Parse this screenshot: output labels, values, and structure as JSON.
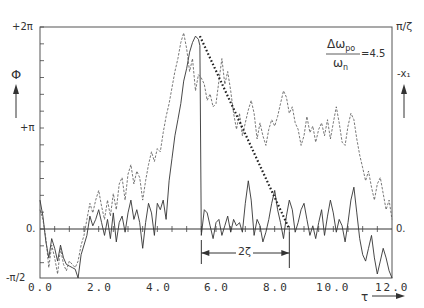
{
  "chart_data": {
    "type": "line",
    "title": "",
    "annotation": {
      "ratio_numerator": "Δω",
      "ratio_numerator_sub": "po",
      "ratio_denominator": "ω",
      "ratio_denominator_sub": "n",
      "ratio_value": "=4.5",
      "span_label": "2ζ",
      "span_start_tau": 5.5,
      "span_end_tau": 8.5
    },
    "xlabel": "τ",
    "ylabel_left": "Φ",
    "ylabel_right": "-x₁",
    "right_axis_top_label": "π/ζ",
    "right_axis_zero_label": "0.",
    "xlim": [
      0,
      12
    ],
    "ylim": [
      -1.5708,
      6.2832
    ],
    "x_ticks": [
      "0.0",
      "2.0",
      "4.0",
      "6.0",
      "8.0",
      "10.0",
      "12.0"
    ],
    "y_ticks_left": [
      "+2π",
      "+π",
      "0.",
      "-π/2"
    ],
    "grid": false,
    "series": [
      {
        "name": "Φ (solid)",
        "style": "solid",
        "x": [
          0.0,
          0.1,
          0.2,
          0.3,
          0.4,
          0.5,
          0.6,
          0.7,
          0.8,
          0.9,
          1.0,
          1.1,
          1.2,
          1.3,
          1.4,
          1.5,
          1.6,
          1.7,
          1.8,
          1.9,
          2.0,
          2.1,
          2.2,
          2.3,
          2.4,
          2.5,
          2.6,
          2.7,
          2.8,
          2.9,
          3.0,
          3.1,
          3.2,
          3.3,
          3.4,
          3.5,
          3.6,
          3.7,
          3.8,
          3.9,
          4.0,
          4.1,
          4.2,
          4.3,
          4.4,
          4.5,
          4.6,
          4.7,
          4.8,
          4.9,
          5.0,
          5.1,
          5.2,
          5.3,
          5.4,
          5.45,
          5.5,
          5.6,
          5.7,
          5.8,
          5.9,
          6.0,
          6.1,
          6.2,
          6.3,
          6.4,
          6.5,
          6.6,
          6.7,
          6.8,
          6.9,
          7.0,
          7.1,
          7.2,
          7.3,
          7.4,
          7.5,
          7.6,
          7.7,
          7.8,
          7.9,
          8.0,
          8.1,
          8.2,
          8.3,
          8.4,
          8.5,
          8.6,
          8.7,
          8.8,
          8.9,
          9.0,
          9.1,
          9.2,
          9.3,
          9.4,
          9.5,
          9.6,
          9.7,
          9.8,
          9.9,
          10.0,
          10.1,
          10.2,
          10.3,
          10.4,
          10.5,
          10.6,
          10.7,
          10.8,
          10.9,
          11.0,
          11.1,
          11.2,
          11.3,
          11.4,
          11.5,
          11.6,
          11.7,
          11.8,
          11.9,
          12.0
        ],
        "y": [
          0.9,
          0.4,
          -0.4,
          -0.9,
          -0.3,
          -0.6,
          -1.0,
          -0.5,
          -0.9,
          -1.1,
          -1.15,
          -1.2,
          -1.25,
          -1.57,
          -0.8,
          -0.5,
          -0.2,
          0.4,
          0.1,
          0.3,
          0.6,
          0.2,
          -0.2,
          0.3,
          -0.3,
          0.5,
          -0.4,
          0.2,
          0.4,
          -0.1,
          0.5,
          0.9,
          0.3,
          0.6,
          0.2,
          -0.6,
          0.2,
          0.8,
          0.5,
          -0.2,
          0.8,
          0.6,
          0.9,
          0.3,
          1.5,
          2.2,
          2.9,
          3.4,
          3.9,
          4.6,
          5.0,
          5.5,
          5.8,
          6.0,
          5.9,
          5.7,
          -0.2,
          0.6,
          0.5,
          0.1,
          -0.3,
          0.2,
          0.3,
          -0.2,
          0.1,
          0.4,
          -0.1,
          0.3,
          0.1,
          0.2,
          -0.1,
          0.8,
          1.5,
          0.9,
          -0.2,
          0.3,
          0.1,
          -0.4,
          -0.1,
          0.3,
          0.8,
          1.2,
          0.6,
          0.2,
          -0.3,
          0.4,
          0.9,
          0.6,
          -0.1,
          0.2,
          0.6,
          0.8,
          0.3,
          -0.2,
          0.1,
          -0.3,
          0.2,
          0.6,
          -0.2,
          0.4,
          0.9,
          0.5,
          -0.1,
          0.3,
          0.1,
          -0.4,
          0.2,
          0.9,
          1.3,
          0.5,
          -0.3,
          -0.8,
          -1.0,
          -0.6,
          -0.2,
          -0.9,
          -1.4,
          -1.0,
          -0.6,
          -0.9,
          -1.3,
          -1.57
        ]
      },
      {
        "name": "-x₁ (dashed)",
        "style": "dashed",
        "x": [
          0.0,
          0.1,
          0.2,
          0.3,
          0.4,
          0.5,
          0.6,
          0.7,
          0.8,
          0.9,
          1.0,
          1.1,
          1.2,
          1.3,
          1.4,
          1.5,
          1.6,
          1.7,
          1.8,
          1.9,
          2.0,
          2.1,
          2.2,
          2.3,
          2.4,
          2.5,
          2.6,
          2.7,
          2.8,
          2.9,
          3.0,
          3.1,
          3.2,
          3.3,
          3.4,
          3.5,
          3.6,
          3.7,
          3.8,
          3.9,
          4.0,
          4.1,
          4.2,
          4.3,
          4.4,
          4.5,
          4.6,
          4.7,
          4.8,
          4.9,
          5.0,
          5.1,
          5.2,
          5.3,
          5.4,
          5.5,
          5.6,
          5.7,
          5.8,
          5.9,
          6.0,
          6.1,
          6.2,
          6.3,
          6.4,
          6.5,
          6.6,
          6.7,
          6.8,
          6.9,
          7.0,
          7.1,
          7.2,
          7.3,
          7.4,
          7.5,
          7.6,
          7.7,
          7.8,
          7.9,
          8.0,
          8.1,
          8.2,
          8.3,
          8.4,
          8.5,
          8.6,
          8.7,
          8.8,
          8.9,
          9.0,
          9.1,
          9.2,
          9.3,
          9.4,
          9.5,
          9.6,
          9.7,
          9.8,
          9.9,
          10.0,
          10.1,
          10.2,
          10.3,
          10.4,
          10.5,
          10.6,
          10.7,
          10.8,
          10.9,
          11.0,
          11.1,
          11.2,
          11.3,
          11.4,
          11.5,
          11.6,
          11.7,
          11.8,
          11.9,
          12.0
        ],
        "y": [
          0.6,
          0.3,
          -0.3,
          -1.2,
          -0.5,
          -0.9,
          -1.4,
          -0.6,
          -1.1,
          -1.3,
          -1.0,
          -1.1,
          -1.2,
          -1.0,
          -0.5,
          -0.2,
          0.3,
          0.8,
          0.5,
          0.9,
          1.2,
          0.7,
          0.3,
          0.9,
          0.4,
          1.1,
          0.6,
          1.4,
          1.6,
          0.9,
          1.7,
          2.0,
          1.4,
          1.8,
          1.6,
          0.9,
          1.5,
          2.0,
          2.4,
          2.1,
          2.5,
          2.4,
          3.0,
          3.5,
          3.9,
          4.4,
          4.9,
          5.3,
          5.8,
          6.1,
          5.6,
          4.9,
          5.3,
          4.3,
          4.8,
          4.7,
          4.5,
          4.0,
          4.2,
          3.8,
          3.9,
          4.6,
          5.3,
          4.5,
          4.9,
          4.3,
          3.6,
          3.1,
          3.6,
          2.9,
          3.3,
          3.7,
          4.0,
          3.6,
          2.8,
          3.3,
          2.9,
          2.6,
          3.1,
          3.4,
          3.2,
          3.5,
          3.9,
          4.3,
          4.1,
          3.6,
          3.8,
          3.3,
          3.1,
          2.6,
          2.9,
          3.5,
          3.0,
          3.2,
          2.7,
          3.1,
          3.3,
          2.9,
          3.4,
          2.8,
          3.3,
          3.8,
          3.3,
          2.7,
          2.6,
          3.2,
          3.6,
          3.4,
          2.8,
          2.3,
          1.9,
          1.5,
          1.8,
          1.3,
          0.9,
          1.4,
          1.6,
          1.1,
          0.6,
          0.9,
          0.3
        ]
      },
      {
        "name": "envelope (dotted)",
        "style": "dotted",
        "x": [
          5.45,
          8.5
        ],
        "y": [
          6.0,
          0.0
        ]
      }
    ],
    "legend_position": "none"
  }
}
